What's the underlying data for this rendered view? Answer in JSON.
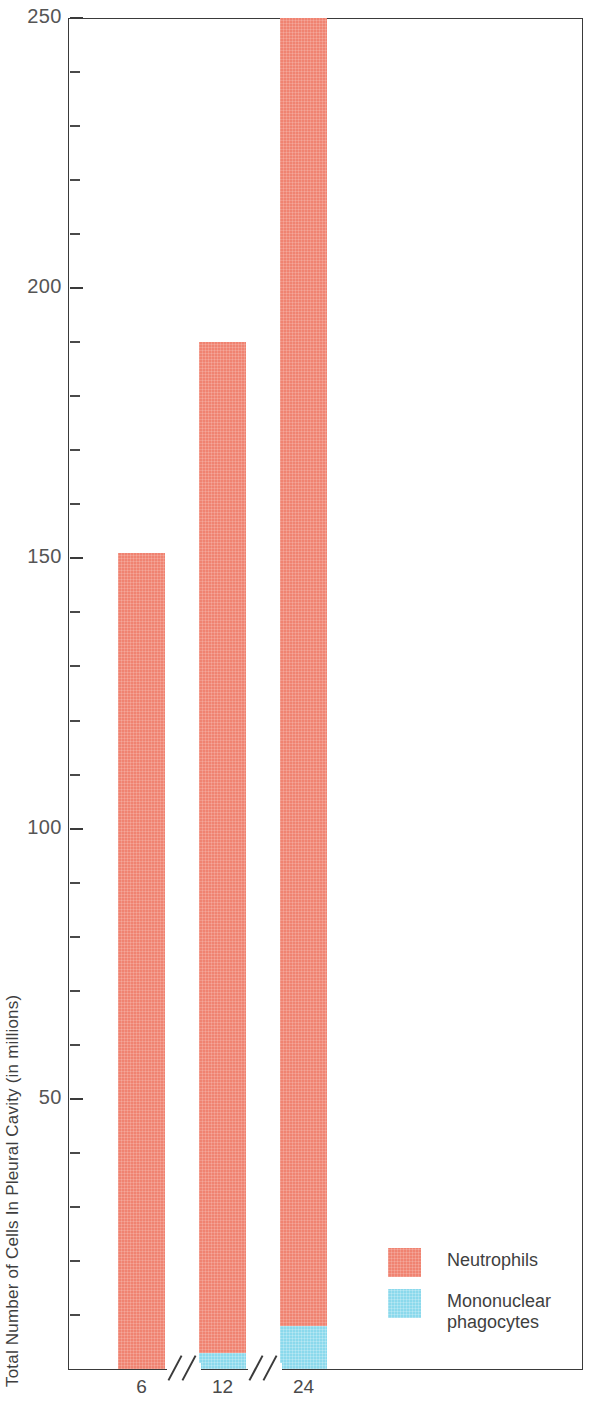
{
  "chart_data": {
    "type": "bar",
    "subtype": "stacked",
    "title": "",
    "xlabel": "",
    "ylabel": "Total Number of Cells In Pleural Cavity (in millions)",
    "categories": [
      "6",
      "12",
      "24"
    ],
    "x_tick_labels": [
      "6",
      "12",
      "24"
    ],
    "y_tick_labels": [
      "250",
      "200",
      "150",
      "100",
      "50"
    ],
    "y_tick_values": [
      250,
      200,
      150,
      100,
      50
    ],
    "y_minor_tick_interval": 10,
    "ylim": [
      0,
      250
    ],
    "grid": false,
    "legend_position": "inside-bottom-right",
    "axis_breaks": 2,
    "series": [
      {
        "name": "Neutrophils",
        "color": "#f08371",
        "values": [
          151,
          187,
          242
        ]
      },
      {
        "name": "Mononuclear phagocytes",
        "color": "#8bd9ec",
        "values": [
          0,
          3,
          8
        ]
      }
    ],
    "totals": [
      151,
      190,
      250
    ]
  },
  "axes": {
    "y_title": "Total Number of Cells In Pleural Cavity (in millions)",
    "y_ticks": [
      {
        "label": "250",
        "value": 250,
        "major": true
      },
      {
        "label": "",
        "value": 240,
        "major": false
      },
      {
        "label": "",
        "value": 230,
        "major": false
      },
      {
        "label": "",
        "value": 220,
        "major": false
      },
      {
        "label": "",
        "value": 210,
        "major": false
      },
      {
        "label": "200",
        "value": 200,
        "major": true
      },
      {
        "label": "",
        "value": 190,
        "major": false
      },
      {
        "label": "",
        "value": 180,
        "major": false
      },
      {
        "label": "",
        "value": 170,
        "major": false
      },
      {
        "label": "",
        "value": 160,
        "major": false
      },
      {
        "label": "150",
        "value": 150,
        "major": true
      },
      {
        "label": "",
        "value": 140,
        "major": false
      },
      {
        "label": "",
        "value": 130,
        "major": false
      },
      {
        "label": "",
        "value": 120,
        "major": false
      },
      {
        "label": "",
        "value": 110,
        "major": false
      },
      {
        "label": "100",
        "value": 100,
        "major": true
      },
      {
        "label": "",
        "value": 90,
        "major": false
      },
      {
        "label": "",
        "value": 80,
        "major": false
      },
      {
        "label": "",
        "value": 70,
        "major": false
      },
      {
        "label": "",
        "value": 60,
        "major": false
      },
      {
        "label": "50",
        "value": 50,
        "major": true
      },
      {
        "label": "",
        "value": 40,
        "major": false
      },
      {
        "label": "",
        "value": 30,
        "major": false
      },
      {
        "label": "",
        "value": 20,
        "major": false
      },
      {
        "label": "",
        "value": 10,
        "major": false
      }
    ],
    "x_labels": [
      "6",
      "12",
      "24"
    ]
  },
  "legend": {
    "entries": [
      {
        "label": "Neutrophils",
        "color": "#f08371"
      },
      {
        "label": "Mononuclear\nphagocytes",
        "color": "#8bd9ec"
      }
    ]
  },
  "colors": {
    "neutrophils": "#f08371",
    "mononuclear_phagocytes": "#8bd9ec",
    "axis": "#3a3a3a",
    "text": "#3f3f3f",
    "background": "#ffffff"
  }
}
